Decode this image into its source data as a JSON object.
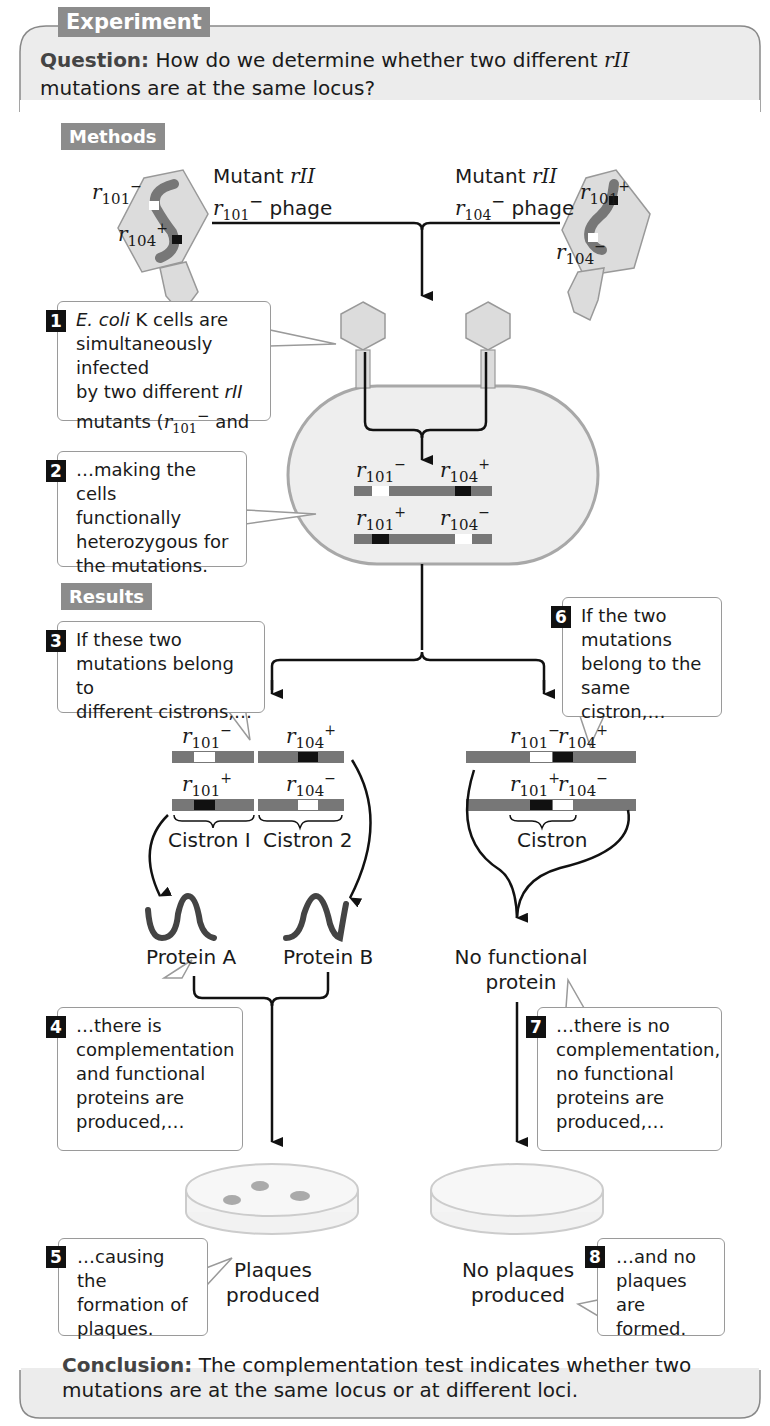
{
  "header": {
    "experiment_tag": "Experiment",
    "question_label": "Question:",
    "question_text_1": "How do we determine whether two different ",
    "question_gene": "rII",
    "question_text_2": "mutations are at the same locus?"
  },
  "methods": {
    "tag": "Methods",
    "phage_left": {
      "line1_prefix": "Mutant ",
      "line1_gene": "rII",
      "line2_gene": "r",
      "line2_sub": "101",
      "line2_sup": "−",
      "line2_suffix": " phage"
    },
    "phage_right": {
      "line1_prefix": "Mutant ",
      "line1_gene": "rII",
      "line2_gene": "r",
      "line2_sub": "104",
      "line2_sup": "−",
      "line2_suffix": " phage"
    },
    "left_phage_alleles": [
      {
        "r": "r",
        "sub": "101",
        "sup": "−"
      },
      {
        "r": "r",
        "sub": "104",
        "sup": "+"
      }
    ],
    "right_phage_alleles": [
      {
        "r": "r",
        "sub": "101",
        "sup": "+"
      },
      {
        "r": "r",
        "sub": "104",
        "sup": "−"
      }
    ],
    "step1": {
      "num": "1",
      "italic1": "E. coli",
      "text1": " K cells are",
      "line2": "simultaneously infected",
      "line3_prefix": "by two different ",
      "line3_italic": "rII",
      "line4_prefix": "mutants (",
      "line4_r": "r",
      "line4_sub": "101",
      "line4_sup": "−",
      "line4_suffix": " and"
    },
    "step2": {
      "num": "2",
      "lines": [
        "…making the cells",
        "functionally",
        "heterozygous for",
        "the mutations."
      ]
    },
    "cell_alleles": {
      "top_left": {
        "r": "r",
        "sub": "101",
        "sup": "−"
      },
      "top_right": {
        "r": "r",
        "sub": "104",
        "sup": "+"
      },
      "bottom_left": {
        "r": "r",
        "sub": "101",
        "sup": "+"
      },
      "bottom_right": {
        "r": "r",
        "sub": "104",
        "sup": "−"
      }
    }
  },
  "results": {
    "tag": "Results",
    "step3": {
      "num": "3",
      "lines": [
        "If these two",
        "mutations belong to",
        "different cistrons,…"
      ]
    },
    "step6": {
      "num": "6",
      "lines": [
        "If the two",
        "mutations",
        "belong to the",
        "same cistron,…"
      ]
    },
    "left_alleles": {
      "top_left": {
        "r": "r",
        "sub": "101",
        "sup": "−"
      },
      "top_right": {
        "r": "r",
        "sub": "104",
        "sup": "+"
      },
      "bottom_left": {
        "r": "r",
        "sub": "101",
        "sup": "+"
      },
      "bottom_right": {
        "r": "r",
        "sub": "104",
        "sup": "−"
      }
    },
    "right_alleles": {
      "top_left": {
        "r": "r",
        "sub": "101",
        "sup": "−"
      },
      "top_right": {
        "r": "r",
        "sub": "104",
        "sup": "+"
      },
      "bottom_left": {
        "r": "r",
        "sub": "101",
        "sup": "+"
      },
      "bottom_right": {
        "r": "r",
        "sub": "104",
        "sup": "−"
      }
    },
    "cistron1": "Cistron I",
    "cistron2": "Cistron 2",
    "cistron_same": "Cistron",
    "protein_a": "Protein A",
    "protein_b": "Protein B",
    "no_protein_1": "No functional",
    "no_protein_2": "protein",
    "step4": {
      "num": "4",
      "lines": [
        "…there is",
        "complementation",
        "and functional",
        "proteins are",
        "produced,…"
      ]
    },
    "step7": {
      "num": "7",
      "lines": [
        "…there is no",
        "complementation,",
        "no functional",
        "proteins are",
        "produced,…"
      ]
    },
    "plaques_1": "Plaques",
    "plaques_2": "produced",
    "no_plaques_1": "No plaques",
    "no_plaques_2": "produced",
    "step5": {
      "num": "5",
      "lines": [
        "…causing the",
        "formation of",
        "plaques."
      ]
    },
    "step8": {
      "num": "8",
      "lines": [
        "…and no",
        "plaques",
        "are formed."
      ]
    }
  },
  "conclusion": {
    "label": "Conclusion:",
    "text_1": " The complementation test indicates whether two",
    "text_2": "mutations are at the same locus or at different loci."
  },
  "colors": {
    "tag_gray": "#8c8c8c",
    "panel_gray": "#ececec",
    "dna_gray": "#777777",
    "phage_fill": "#dcdcdc",
    "cell_fill": "#eeeeee",
    "cell_border": "#a8a8a8"
  }
}
